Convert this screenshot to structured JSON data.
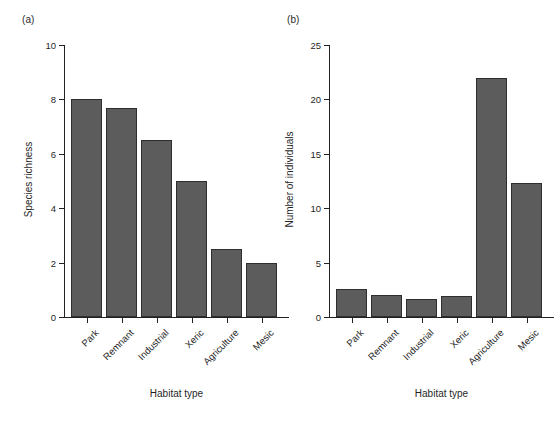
{
  "figure": {
    "background_color": "#ffffff",
    "bar_fill_color": "#5c5c5c",
    "bar_border_color": "#2e2e2e",
    "axis_color": "#222222"
  },
  "panels": [
    {
      "tag": "(a)",
      "xlabel": "Habitat type",
      "ylabel": "Species richness"
    },
    {
      "tag": "(b)",
      "xlabel": "Habitat type",
      "ylabel": "Number of individuals"
    }
  ],
  "chart_data": [
    {
      "type": "bar",
      "title": "(a)",
      "categories": [
        "Park",
        "Remnant",
        "Industrial",
        "Xeric",
        "Agriculture",
        "Mesic"
      ],
      "values": [
        8.0,
        7.7,
        6.5,
        5.0,
        2.5,
        2.0
      ],
      "xlabel": "Habitat type",
      "ylabel": "Species richness",
      "ylim": [
        0,
        10
      ],
      "yticks": [
        0,
        2,
        4,
        6,
        8,
        10
      ],
      "ytick_labels": [
        "0",
        "2",
        "4",
        "6",
        "8",
        "10"
      ],
      "grid": false,
      "legend": "none",
      "xtick_label_rotation": -45
    },
    {
      "type": "bar",
      "title": "(b)",
      "categories": [
        "Park",
        "Remnant",
        "Industrial",
        "Xeric",
        "Agriculture",
        "Mesic"
      ],
      "values": [
        2.6,
        2.0,
        1.7,
        1.9,
        22.0,
        12.3
      ],
      "xlabel": "Habitat type",
      "ylabel": "Number of individuals",
      "ylim": [
        0,
        25
      ],
      "yticks": [
        0,
        5,
        10,
        15,
        20,
        25
      ],
      "ytick_labels": [
        "0",
        "5",
        "10",
        "15",
        "20",
        "25"
      ],
      "grid": false,
      "legend": "none",
      "xtick_label_rotation": -45
    }
  ]
}
